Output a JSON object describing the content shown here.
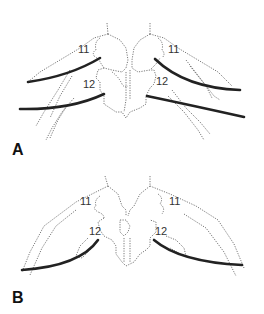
{
  "figure": {
    "panels": [
      {
        "id": "A",
        "label": "A",
        "vertebra_labels": {
          "upper_left": "11",
          "upper_right": "11",
          "lower_left": "12",
          "lower_right": "12"
        }
      },
      {
        "id": "B",
        "label": "B",
        "vertebra_labels": {
          "upper_left": "11",
          "upper_right": "11",
          "lower_left": "12",
          "lower_right": "12"
        }
      }
    ],
    "colors": {
      "outline": "#555555",
      "highlighted_rib": "#222222",
      "background": "#ffffff"
    }
  }
}
